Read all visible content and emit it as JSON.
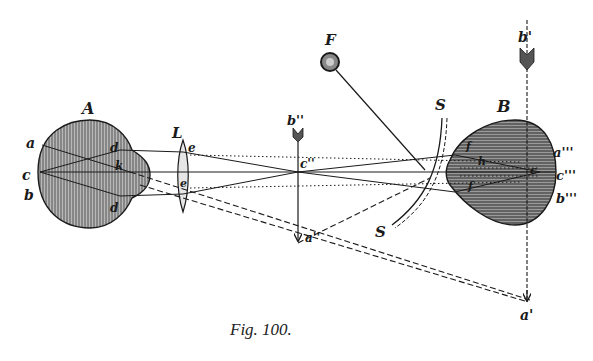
{
  "caption": "Fig. 100.",
  "colors": {
    "ink": "#1a1a1a",
    "shade": "#8a8a8a",
    "background": "#ffffff"
  },
  "labels": {
    "eye_a": "A",
    "eye_b": "B",
    "lens": "L",
    "lamp": "F",
    "mirror_top": "S",
    "mirror_bottom": "S",
    "a": "a",
    "b": "b",
    "c": "c",
    "d_top": "d",
    "d_bottom": "d",
    "k": "k",
    "e_top": "e",
    "e_bottom": "e",
    "b2": "b''",
    "c2": "c''",
    "a2": "a''",
    "b1": "b'",
    "a1": "a'",
    "a3": "a'''",
    "b3": "b'''",
    "c3": "c'''",
    "f_top": "f",
    "f_bottom": "f",
    "h": "h",
    "c_inner": "c"
  }
}
